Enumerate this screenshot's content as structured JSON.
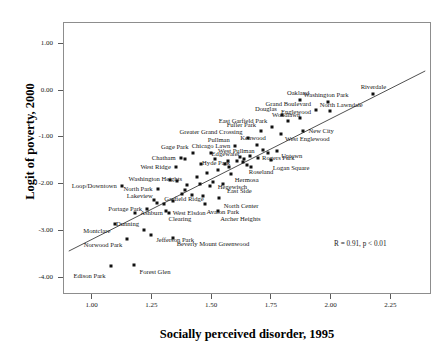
{
  "chart_data": {
    "type": "scatter",
    "title": "",
    "xlabel": "Socially perceived disorder, 1995",
    "ylabel": "Logit of poverty, 2000",
    "xlim": [
      0.88,
      2.42
    ],
    "ylim": [
      -4.35,
      1.45
    ],
    "xticks": [
      "1.00",
      "1.25",
      "1.50",
      "1.75",
      "2.00",
      "2.25"
    ],
    "xtick_values": [
      1.0,
      1.25,
      1.5,
      1.75,
      2.0,
      2.25
    ],
    "yticks": [
      "1.00",
      "0.00",
      "-1.00",
      "-2.00",
      "-3.00",
      "-4.00"
    ],
    "ytick_values": [
      1.0,
      0.0,
      -1.0,
      -2.0,
      -3.0,
      -4.0
    ],
    "grid": false,
    "legend": "none",
    "annotation": "R = 0.91, p < 0.01",
    "annotation_x": 2.12,
    "annotation_y": -3.27,
    "fit_line": {
      "type": "linear",
      "x_start": 0.9,
      "y_start": -3.45,
      "x_end": 2.4,
      "y_end": 0.42
    },
    "point_color": "#111111",
    "line_color": "#3a3a3a",
    "points": [
      {
        "label": "Edison Park",
        "x": 1.075,
        "y": -3.74,
        "lp": "r",
        "dx": -5,
        "dy": 10
      },
      {
        "label": "Forest Glen",
        "x": 1.175,
        "y": -3.7,
        "lp": "l",
        "dx": 5,
        "dy": 7
      },
      {
        "label": "Norwood Park",
        "x": 1.145,
        "y": -3.15,
        "lp": "r",
        "dx": -5,
        "dy": 6
      },
      {
        "label": "Montclare",
        "x": 1.095,
        "y": -2.84,
        "lp": "r",
        "dx": -5,
        "dy": 7
      },
      {
        "label": "Dunning",
        "x": 1.215,
        "y": -2.97,
        "lp": "r",
        "dx": -5,
        "dy": -6
      },
      {
        "label": "Jefferson Park",
        "x": 1.245,
        "y": -3.08,
        "lp": "l",
        "dx": 5,
        "dy": 5
      },
      {
        "label": "Beverly Mount Greenwood",
        "x": 1.335,
        "y": -3.13,
        "lp": "l",
        "dx": 4,
        "dy": 6
      },
      {
        "label": "Ashburn",
        "x": 1.178,
        "y": -2.6,
        "lp": "l",
        "dx": 5,
        "dy": 0
      },
      {
        "label": "Portage Park",
        "x": 1.228,
        "y": -2.52,
        "lp": "r",
        "dx": -5,
        "dy": 0
      },
      {
        "label": "Lakeview",
        "x": 1.268,
        "y": -2.38,
        "lp": "r",
        "dx": -4,
        "dy": -7
      },
      {
        "label": "Clearing",
        "x": 1.305,
        "y": -2.55,
        "lp": "l",
        "dx": 3,
        "dy": 8
      },
      {
        "label": "West Elsdon",
        "x": 1.318,
        "y": -2.6,
        "lp": "l",
        "dx": 4,
        "dy": 0
      },
      {
        "label": "North Park",
        "x": 1.272,
        "y": -2.1,
        "lp": "r",
        "dx": -5,
        "dy": 0
      },
      {
        "label": "Loop/Downtown",
        "x": 1.122,
        "y": -2.02,
        "lp": "r",
        "dx": -5,
        "dy": 0
      },
      {
        "label": "Washington Heights",
        "x": 1.395,
        "y": -2.0,
        "lp": "r",
        "dx": -5,
        "dy": -6
      },
      {
        "label": "Garfield Ridge",
        "x": 1.375,
        "y": -2.2,
        "lp": "l",
        "dx": -18,
        "dy": 5
      },
      {
        "label": "West Ridge",
        "x": 1.348,
        "y": -1.62,
        "lp": "r",
        "dx": -5,
        "dy": 0
      },
      {
        "label": "Chatham",
        "x": 1.368,
        "y": -1.42,
        "lp": "r",
        "dx": -5,
        "dy": 0
      },
      {
        "label": "Gage Park",
        "x": 1.418,
        "y": -1.33,
        "lp": "r",
        "dx": -4,
        "dy": -6
      },
      {
        "label": "Chicago Lawn",
        "x": 1.495,
        "y": -1.33,
        "lp": "c",
        "dx": 0,
        "dy": -7
      },
      {
        "label": "Hyde Park",
        "x": 1.525,
        "y": -1.68,
        "lp": "c",
        "dx": -2,
        "dy": -7
      },
      {
        "label": "Edgewater",
        "x": 1.565,
        "y": -1.5,
        "lp": "c",
        "dx": -2,
        "dy": -7
      },
      {
        "label": "Hegewisch",
        "x": 1.503,
        "y": -1.93,
        "lp": "l",
        "dx": 5,
        "dy": 5
      },
      {
        "label": "Avalon Park",
        "x": 1.468,
        "y": -2.4,
        "lp": "l",
        "dx": 2,
        "dy": 8
      },
      {
        "label": "North Center",
        "x": 1.528,
        "y": -2.28,
        "lp": "l",
        "dx": 5,
        "dy": 8
      },
      {
        "label": "Archer Heights",
        "x": 1.525,
        "y": -2.55,
        "lp": "l",
        "dx": 2,
        "dy": 8
      },
      {
        "label": "East Side",
        "x": 1.545,
        "y": -1.99,
        "lp": "l",
        "dx": 4,
        "dy": 7
      },
      {
        "label": "Hermosa",
        "x": 1.578,
        "y": -1.78,
        "lp": "l",
        "dx": 4,
        "dy": 6
      },
      {
        "label": "Roseland",
        "x": 1.645,
        "y": -1.58,
        "lp": "l",
        "dx": 2,
        "dy": 7
      },
      {
        "label": "West Pullman",
        "x": 1.618,
        "y": -1.41,
        "lp": "c",
        "dx": -4,
        "dy": -6
      },
      {
        "label": "Rogers Park",
        "x": 1.692,
        "y": -1.42,
        "lp": "l",
        "dx": 4,
        "dy": 0
      },
      {
        "label": "Logan Square",
        "x": 1.745,
        "y": -1.48,
        "lp": "l",
        "dx": 2,
        "dy": 8
      },
      {
        "label": "Pullman",
        "x": 1.595,
        "y": -1.18,
        "lp": "r",
        "dx": -5,
        "dy": -6
      },
      {
        "label": "Kenwood",
        "x": 1.688,
        "y": -1.16,
        "lp": "c",
        "dx": -4,
        "dy": -7
      },
      {
        "label": "Uptown",
        "x": 1.772,
        "y": -1.29,
        "lp": "l",
        "dx": 4,
        "dy": 5
      },
      {
        "label": "Greater Grand Crossing",
        "x": 1.648,
        "y": -1.01,
        "lp": "r",
        "dx": -5,
        "dy": -6
      },
      {
        "label": "Fuller Park",
        "x": 1.705,
        "y": -0.86,
        "lp": "r",
        "dx": -5,
        "dy": -6
      },
      {
        "label": "West Englewood",
        "x": 1.788,
        "y": -0.92,
        "lp": "l",
        "dx": 4,
        "dy": 5
      },
      {
        "label": "East Garfield Park",
        "x": 1.752,
        "y": -0.76,
        "lp": "r",
        "dx": -5,
        "dy": -6
      },
      {
        "label": "New City",
        "x": 1.882,
        "y": -0.85,
        "lp": "l",
        "dx": 5,
        "dy": 0
      },
      {
        "label": "Woodlawn",
        "x": 1.818,
        "y": -0.63,
        "lp": "c",
        "dx": -2,
        "dy": -6
      },
      {
        "label": "Douglas",
        "x": 1.792,
        "y": -0.52,
        "lp": "r",
        "dx": -5,
        "dy": -6
      },
      {
        "label": "Englewood",
        "x": 1.868,
        "y": -0.57,
        "lp": "c",
        "dx": -4,
        "dy": -6
      },
      {
        "label": "Grand Boulevard",
        "x": 1.935,
        "y": -0.4,
        "lp": "r",
        "dx": -5,
        "dy": -6
      },
      {
        "label": "North Lawndale",
        "x": 1.992,
        "y": -0.42,
        "lp": "l",
        "dx": -10,
        "dy": -6
      },
      {
        "label": "Oakland",
        "x": 1.868,
        "y": -0.2,
        "lp": "c",
        "dx": -2,
        "dy": -7
      },
      {
        "label": "Washington Park",
        "x": 1.985,
        "y": -0.24,
        "lp": "c",
        "dx": -2,
        "dy": -7
      },
      {
        "label": "Riverdale",
        "x": 2.175,
        "y": -0.06,
        "lp": "c",
        "dx": 0,
        "dy": -7
      }
    ],
    "extra_points": [
      {
        "x": 1.322,
        "y": -1.9
      },
      {
        "x": 1.352,
        "y": -1.92
      },
      {
        "x": 1.388,
        "y": -2.12
      },
      {
        "x": 1.414,
        "y": -2.22
      },
      {
        "x": 1.448,
        "y": -1.98
      },
      {
        "x": 1.462,
        "y": -2.24
      },
      {
        "x": 1.436,
        "y": -1.83
      },
      {
        "x": 1.478,
        "y": -1.75
      },
      {
        "x": 1.492,
        "y": -2.02
      },
      {
        "x": 1.555,
        "y": -1.55
      },
      {
        "x": 1.572,
        "y": -1.62
      },
      {
        "x": 1.602,
        "y": -1.5
      },
      {
        "x": 1.628,
        "y": -1.52
      },
      {
        "x": 1.634,
        "y": -1.45
      },
      {
        "x": 1.658,
        "y": -1.38
      },
      {
        "x": 1.662,
        "y": -1.62
      },
      {
        "x": 1.712,
        "y": -1.26
      },
      {
        "x": 1.735,
        "y": -1.32
      },
      {
        "x": 1.455,
        "y": -1.55
      },
      {
        "x": 1.388,
        "y": -1.45
      },
      {
        "x": 1.512,
        "y": -1.45
      },
      {
        "x": 1.258,
        "y": -2.32
      },
      {
        "x": 1.298,
        "y": -2.42
      },
      {
        "x": 1.335,
        "y": -2.35
      }
    ]
  }
}
